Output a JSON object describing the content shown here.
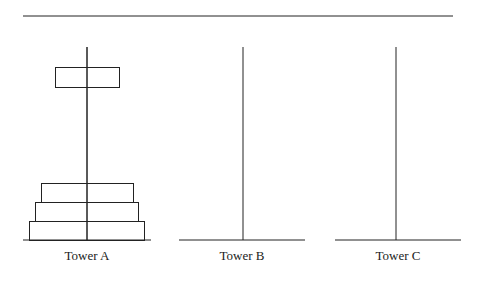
{
  "diagram": {
    "towers": [
      {
        "id": "A",
        "label": "Tower A",
        "peg_x": 87,
        "base": [
          23,
          151
        ]
      },
      {
        "id": "B",
        "label": "Tower B",
        "peg_x": 243,
        "base": [
          179,
          305
        ]
      },
      {
        "id": "C",
        "label": "Tower C",
        "peg_x": 396,
        "base": [
          335,
          461
        ]
      }
    ],
    "disks": [
      {
        "tower": "A",
        "x": 29,
        "y": 221,
        "w": 115,
        "h": 19
      },
      {
        "tower": "A",
        "x": 35,
        "y": 202,
        "w": 103,
        "h": 19
      },
      {
        "tower": "A",
        "x": 41,
        "y": 183,
        "w": 92,
        "h": 19
      },
      {
        "tower": "A",
        "x": 55,
        "y": 67,
        "w": 64,
        "h": 20,
        "state": "lifted"
      }
    ],
    "colors": {
      "stroke": "#222222",
      "background": "#ffffff"
    }
  }
}
